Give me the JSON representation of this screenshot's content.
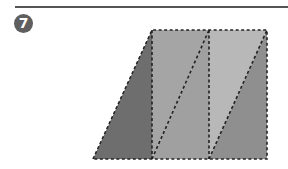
{
  "problem": {
    "number": "7"
  },
  "figure": {
    "colors": {
      "dark": "#6e6e6e",
      "medium": "#9a9a9a",
      "light": "#b5b5b5",
      "line": "#222222",
      "rule": "#555555"
    },
    "vertices": {
      "bottom_left": [
        93,
        159
      ],
      "top_left": [
        152,
        30
      ],
      "top_mid": [
        209,
        30
      ],
      "top_right": [
        267,
        30
      ],
      "bottom_right": [
        267,
        159
      ],
      "bottom_mid1": [
        152,
        159
      ],
      "bottom_mid2": [
        209,
        159
      ]
    }
  }
}
